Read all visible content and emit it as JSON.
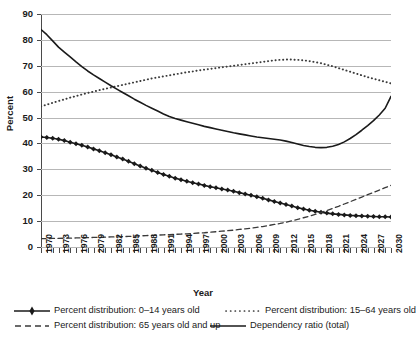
{
  "chart_data": {
    "type": "line",
    "title": "",
    "xlabel": "Year",
    "ylabel": "Percent",
    "ylim": [
      0,
      90
    ],
    "ytick_step": 10,
    "yticks": [
      0,
      10,
      20,
      30,
      40,
      50,
      60,
      70,
      80,
      90
    ],
    "xlim": [
      1970,
      2030
    ],
    "grid": "horizontal",
    "legend_position": "below",
    "x": [
      1970,
      1971,
      1972,
      1973,
      1974,
      1975,
      1976,
      1977,
      1978,
      1979,
      1980,
      1981,
      1982,
      1983,
      1984,
      1985,
      1986,
      1987,
      1988,
      1989,
      1990,
      1991,
      1992,
      1993,
      1994,
      1995,
      1996,
      1997,
      1998,
      1999,
      2000,
      2001,
      2002,
      2003,
      2004,
      2005,
      2006,
      2007,
      2008,
      2009,
      2010,
      2011,
      2012,
      2013,
      2014,
      2015,
      2016,
      2017,
      2018,
      2019,
      2020,
      2021,
      2022,
      2023,
      2024,
      2025,
      2026,
      2027,
      2028,
      2029,
      2030
    ],
    "xtick_labels": [
      "1970",
      "1973",
      "1976",
      "2079",
      "1982",
      "1985",
      "1988",
      "1991",
      "1994",
      "1997",
      "2000",
      "2003",
      "2006",
      "2009",
      "2012",
      "2015",
      "2018",
      "2021",
      "2024",
      "2027",
      "2030"
    ],
    "xtick_label_years": [
      1970,
      1973,
      1976,
      1979,
      1982,
      1985,
      1988,
      1991,
      1994,
      1997,
      2000,
      2003,
      2006,
      2009,
      2012,
      2015,
      2018,
      2021,
      2024,
      2027,
      2030
    ],
    "series": [
      {
        "name": "Percent distribution: 0–14 years old",
        "key": "pct_0_14",
        "style": "solid-marker",
        "color": "#1a1a1a",
        "values": [
          42.5,
          42.3,
          42.0,
          41.6,
          41.1,
          40.5,
          39.9,
          39.3,
          38.6,
          37.9,
          37.2,
          36.4,
          35.6,
          34.8,
          34.0,
          33.1,
          32.2,
          31.3,
          30.4,
          29.6,
          28.8,
          28.0,
          27.3,
          26.6,
          26.0,
          25.4,
          24.8,
          24.3,
          23.8,
          23.3,
          22.9,
          22.4,
          22.0,
          21.5,
          21.0,
          20.5,
          20.0,
          19.4,
          18.8,
          18.2,
          17.6,
          17.0,
          16.4,
          15.8,
          15.2,
          14.7,
          14.2,
          13.8,
          13.4,
          13.1,
          12.8,
          12.6,
          12.4,
          12.2,
          12.1,
          12.0,
          11.9,
          11.8,
          11.7,
          11.7,
          11.6
        ]
      },
      {
        "name": "Percent distribution: 15–64 years old",
        "key": "pct_15_64",
        "style": "dotted",
        "color": "#3a3a3a",
        "values": [
          54.3,
          55.0,
          55.7,
          56.4,
          57.0,
          57.7,
          58.3,
          58.9,
          59.5,
          60.0,
          60.6,
          61.1,
          61.6,
          62.1,
          62.6,
          63.1,
          63.6,
          64.1,
          64.6,
          65.1,
          65.5,
          65.9,
          66.3,
          66.7,
          67.1,
          67.5,
          67.8,
          68.2,
          68.5,
          68.8,
          69.1,
          69.4,
          69.7,
          70.0,
          70.3,
          70.6,
          70.9,
          71.2,
          71.5,
          71.8,
          72.1,
          72.3,
          72.4,
          72.4,
          72.3,
          72.1,
          71.8,
          71.4,
          71.0,
          70.4,
          69.8,
          69.1,
          68.4,
          67.7,
          67.0,
          66.3,
          65.6,
          65.0,
          64.4,
          63.8,
          63.2
        ]
      },
      {
        "name": "Percent distribution: 65 years old and up",
        "key": "pct_65_up",
        "style": "dashed",
        "color": "#3a3a3a",
        "values": [
          3.2,
          3.2,
          3.3,
          3.3,
          3.4,
          3.4,
          3.5,
          3.5,
          3.6,
          3.7,
          3.7,
          3.8,
          3.9,
          3.9,
          4.0,
          4.1,
          4.2,
          4.3,
          4.4,
          4.5,
          4.6,
          4.7,
          4.8,
          4.9,
          5.0,
          5.1,
          5.2,
          5.4,
          5.5,
          5.7,
          5.9,
          6.1,
          6.3,
          6.5,
          6.8,
          7.0,
          7.3,
          7.6,
          7.9,
          8.3,
          8.7,
          9.1,
          9.6,
          10.1,
          10.7,
          11.3,
          11.9,
          12.6,
          13.3,
          14.1,
          14.9,
          15.7,
          16.6,
          17.5,
          18.4,
          19.3,
          20.2,
          21.1,
          22.0,
          22.9,
          23.8
        ]
      },
      {
        "name": "Dependency ratio (total)",
        "key": "dependency_ratio",
        "style": "solid",
        "color": "#1a1a1a",
        "values": [
          84.0,
          82.0,
          79.6,
          77.2,
          75.3,
          73.4,
          71.5,
          69.7,
          68.0,
          66.5,
          65.1,
          63.7,
          62.3,
          61.0,
          59.7,
          58.4,
          57.1,
          55.9,
          54.7,
          53.6,
          52.5,
          51.4,
          50.4,
          49.6,
          49.0,
          48.4,
          47.8,
          47.2,
          46.6,
          46.1,
          45.6,
          45.1,
          44.6,
          44.1,
          43.7,
          43.3,
          42.9,
          42.5,
          42.2,
          41.9,
          41.6,
          41.3,
          40.9,
          40.4,
          39.8,
          39.2,
          38.8,
          38.5,
          38.4,
          38.5,
          38.9,
          39.6,
          40.6,
          41.9,
          43.4,
          45.1,
          46.9,
          48.8,
          51.0,
          53.6,
          58.2
        ]
      }
    ]
  },
  "axis": {
    "y_title": "Percent",
    "x_title": "Year"
  },
  "legend": {
    "entries": [
      {
        "label": "Percent distribution: 0–14 years old",
        "key": "solid-marker-key-icon"
      },
      {
        "label": "Percent distribution: 15–64 years old",
        "key": "dotted-line-key-icon"
      },
      {
        "label": "Percent distribution: 65 years old and up",
        "key": "dashed-line-key-icon"
      },
      {
        "label": "Dependency ratio (total)",
        "key": "solid-line-key-icon"
      }
    ]
  }
}
